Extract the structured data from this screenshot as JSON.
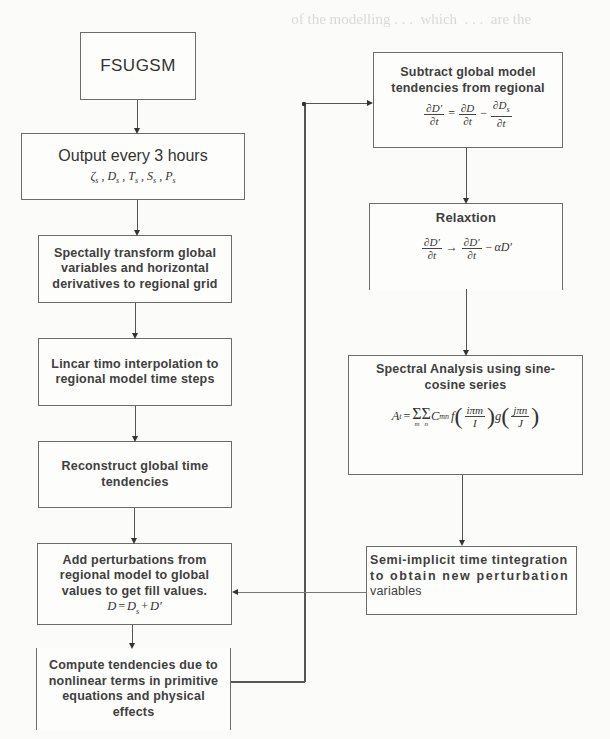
{
  "diagram": {
    "type": "flowchart",
    "left_column": [
      {
        "id": "fsugsm",
        "label": "FSUGSM"
      },
      {
        "id": "output",
        "label": "Output every 3 hours",
        "math": "ζ_s , D_s , T_s , S_s , P_s"
      },
      {
        "id": "spectral_transform",
        "label": "Spectally transform global variables and horizontal derivatives to regional grid",
        "lines": [
          "Spectally transform global",
          "variables and horizontal",
          "derivatives to regional grid"
        ]
      },
      {
        "id": "linear_interp",
        "lines": [
          "Lincar timo interpolation to",
          "regional model time steps"
        ]
      },
      {
        "id": "reconstruct",
        "lines": [
          "Reconstruct global time",
          "tendencies"
        ]
      },
      {
        "id": "add_perturbations",
        "lines": [
          "Add perturbations from",
          "regional model to global",
          "values to get fill values."
        ],
        "math": "D = D_s + D'"
      },
      {
        "id": "compute_tendencies",
        "lines": [
          "Compute tendencies due to",
          "nonlinear terms in primitive",
          "equations and physical",
          "effects"
        ]
      }
    ],
    "right_column": [
      {
        "id": "subtract",
        "lines": [
          "Subtract global model",
          "tendencies from regional"
        ],
        "math": "∂D'/∂t = ∂D/∂t − ∂D_s/∂t"
      },
      {
        "id": "relaxation",
        "label": "Relaxtion",
        "math": "∂D'/∂t → ∂D'/∂t − αD'"
      },
      {
        "id": "spectral_analysis",
        "lines": [
          "Spectral Analysis using sine-",
          "cosine series"
        ],
        "math": "A_t = Σ Σ C_mn f(iπm/I) g(jπn/J)"
      },
      {
        "id": "semi_implicit",
        "lines": [
          "Semi-implicit time tintegration",
          "to obtain new perturbation",
          "variables"
        ]
      }
    ],
    "edges": [
      [
        "fsugsm",
        "output"
      ],
      [
        "output",
        "spectral_transform"
      ],
      [
        "spectral_transform",
        "linear_interp"
      ],
      [
        "linear_interp",
        "reconstruct"
      ],
      [
        "reconstruct",
        "add_perturbations"
      ],
      [
        "add_perturbations",
        "compute_tendencies"
      ],
      [
        "compute_tendencies",
        "subtract"
      ],
      [
        "subtract",
        "relaxation"
      ],
      [
        "relaxation",
        "spectral_analysis"
      ],
      [
        "spectral_analysis",
        "semi_implicit"
      ],
      [
        "semi_implicit",
        "add_perturbations"
      ]
    ]
  },
  "math": {
    "output_vars": [
      "ζ",
      "D",
      "T",
      "S",
      "P"
    ],
    "sub_s": "s",
    "dDprime": "∂D′",
    "dD": "∂D",
    "dDs": "∂D",
    "dt": "∂t",
    "eq": "=",
    "minus": "−",
    "arrow": "→",
    "alpha_D": "αD′",
    "sum": "Σ",
    "A_t": "A",
    "t": "t",
    "plus": "+",
    "D": "D",
    "Dprime": "D′",
    "C": "C",
    "mn": "mn",
    "m_idx": "m",
    "n_idx": "n",
    "f": "f",
    "g": "g",
    "frac1_num": "iπm",
    "frac1_den": "I",
    "frac2_num": "jπn",
    "frac2_den": "J",
    "comma": " , "
  },
  "ghost_text": [
    "",
    "           of the modelling . . .  which  . . .  are the        ",
    "                                                               ",
    "     ",
    "                    tinuous linear terms  Discrete   . . .     ",
    "                                                          "
  ]
}
